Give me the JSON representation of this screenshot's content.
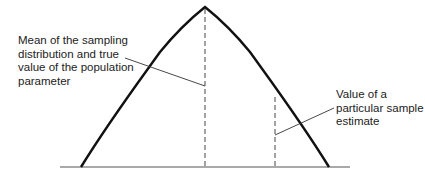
{
  "diagram": {
    "labels": {
      "mean": "Mean of the sampling\ndistribution and true\nvalue of the population\nparameter",
      "sample": "Value of a\nparticular sample\nestimate"
    },
    "colors": {
      "curve": "#111111",
      "lines": "#333333",
      "text": "#222222"
    }
  }
}
